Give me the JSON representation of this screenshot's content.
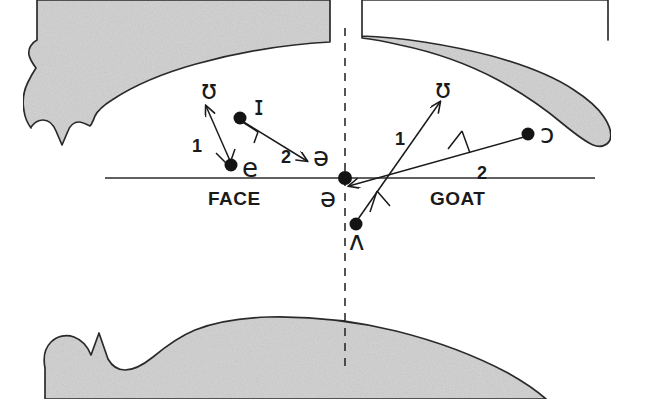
{
  "figure": {
    "kind": "vowel-diagram",
    "background": "#ffffff",
    "ink_color": "#1a1a1a",
    "organ_fill": "#d4d4d4",
    "organ_stroke": "#2b2b2b"
  },
  "axes": {
    "baseline": {
      "name": "horizontal-baseline",
      "x1": 105,
      "y1": 178,
      "x2": 595,
      "y2": 178
    },
    "midline": {
      "name": "vertical-dashed-midline",
      "x": 345,
      "y1": 28,
      "y2": 372,
      "dash": "8 7"
    }
  },
  "word_labels": [
    {
      "id": "face",
      "text": "FACE",
      "x": 208,
      "y": 205
    },
    {
      "id": "goat",
      "text": "GOAT",
      "x": 434,
      "y": 205
    }
  ],
  "number_labels": [
    {
      "id": "face-1",
      "text": "1",
      "x": 196,
      "y": 152
    },
    {
      "id": "face-2",
      "text": "2",
      "x": 285,
      "y": 163
    },
    {
      "id": "goat-1",
      "text": "1",
      "x": 399,
      "y": 145
    },
    {
      "id": "goat-2",
      "text": "2",
      "x": 481,
      "y": 179
    }
  ],
  "vowel_points": [
    {
      "id": "e",
      "symbol": "e",
      "x": 231,
      "y": 165,
      "label_x": 240,
      "label_y": 176
    },
    {
      "id": "i-small",
      "symbol": "ɪ",
      "x": 240,
      "y": 118,
      "label_x": 252,
      "label_y": 115
    },
    {
      "id": "schwa-c",
      "symbol": "ə",
      "x": 345,
      "y": 178,
      "label_x": 327,
      "label_y": 205
    },
    {
      "id": "wedge",
      "symbol": "ʌ",
      "x": 356,
      "y": 224,
      "label_x": 352,
      "label_y": 250
    },
    {
      "id": "o-open",
      "symbol": "ɔ",
      "x": 528,
      "y": 134,
      "label_x": 540,
      "label_y": 134
    }
  ],
  "target_labels": [
    {
      "id": "face-upsilon",
      "symbol": "ʊ",
      "x": 210,
      "y": 99
    },
    {
      "id": "face-schwa",
      "symbol": "ə",
      "x": 316,
      "y": 165
    },
    {
      "id": "goat-upsilon",
      "symbol": "ʊ",
      "x": 443,
      "y": 98
    }
  ],
  "arrows": [
    {
      "id": "face-arrow-1",
      "from": "e",
      "to": "ʊ",
      "x1": 231,
      "y1": 163,
      "x2": 206,
      "y2": 106,
      "number": "1"
    },
    {
      "id": "face-arrow-2",
      "from": "ɪ",
      "to": "ə",
      "x1": 242,
      "y1": 121,
      "x2": 305,
      "y2": 160,
      "number": "2"
    },
    {
      "id": "goat-arrow-1",
      "from": "ʌ",
      "to": "ʊ",
      "x1": 356,
      "y1": 222,
      "x2": 440,
      "y2": 102,
      "number": "1"
    },
    {
      "id": "goat-arrow-2",
      "from": "ɔ",
      "to": "ə",
      "x1": 526,
      "y1": 136,
      "x2": 347,
      "y2": 184,
      "number": "2"
    }
  ],
  "organs": [
    {
      "id": "upper-jaw-left",
      "name": "upper-jaw-palate-left"
    },
    {
      "id": "upper-jaw-right",
      "name": "upper-jaw-palate-right"
    },
    {
      "id": "lower-jaw",
      "name": "lower-jaw-tongue"
    }
  ]
}
